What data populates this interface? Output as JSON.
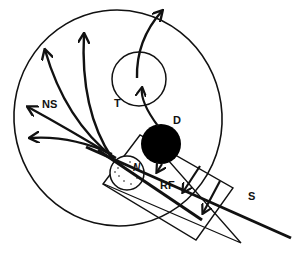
{
  "diagram": {
    "type": "schematic",
    "labels": {
      "ns": "NS",
      "t": "T",
      "d": "D",
      "n": "N",
      "rf": "RF",
      "s": "S"
    },
    "elements": [
      {
        "id": "outer-ellipse",
        "shape": "ellipse"
      },
      {
        "id": "T",
        "shape": "circle",
        "fill": "none"
      },
      {
        "id": "D",
        "shape": "circle",
        "fill": "#000000"
      },
      {
        "id": "N",
        "shape": "circle",
        "fill": "stippled"
      },
      {
        "id": "RF",
        "shape": "rotated-rectangle"
      },
      {
        "id": "S",
        "shape": "thick-line"
      },
      {
        "id": "wedge",
        "shape": "triangle"
      },
      {
        "id": "NS",
        "shape": "arrow-fan",
        "count": 5
      }
    ],
    "colors": {
      "stroke": "#111111",
      "background": "#ffffff",
      "fill_dark": "#000000"
    }
  }
}
